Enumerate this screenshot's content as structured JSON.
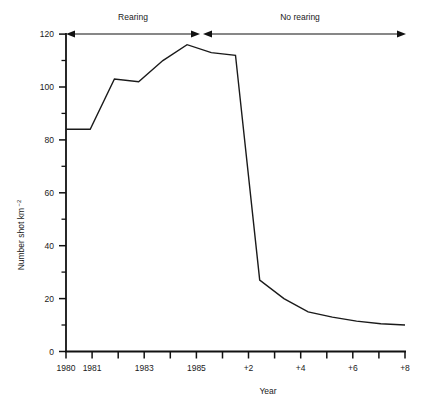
{
  "chart_data": {
    "type": "line",
    "title": "",
    "xlabel": "Year",
    "ylabel": "Number shot km",
    "ylabel_exponent": "−2",
    "ylim": [
      0,
      120
    ],
    "ytick_values": [
      0,
      20,
      40,
      60,
      80,
      100,
      120
    ],
    "ytick_labels": [
      "0",
      "20",
      "40",
      "60",
      "80",
      "100",
      "120"
    ],
    "yminor_values": [
      10,
      30,
      50,
      70,
      90,
      110
    ],
    "grid": false,
    "legend": "none",
    "x": [
      "1980",
      "1981",
      "1982",
      "1983",
      "1984",
      "1985",
      "1986",
      "+1",
      "+2",
      "+3",
      "+4",
      "+5",
      "+6",
      "+7",
      "+8"
    ],
    "xtick_labels": [
      "1980",
      "1981",
      "",
      "1983",
      "",
      "1985",
      "",
      "",
      "+2",
      "",
      "+4",
      "",
      "+6",
      "",
      "+8"
    ],
    "values": [
      84,
      84,
      103,
      102,
      110,
      116,
      113,
      112,
      27,
      20,
      15,
      13,
      11.5,
      10.5,
      10
    ],
    "series": [
      {
        "name": "Number shot per square km",
        "values": [
          84,
          84,
          103,
          102,
          110,
          116,
          113,
          112,
          27,
          20,
          15,
          13,
          11.5,
          10.5,
          10
        ]
      }
    ],
    "annotations": [
      {
        "label": "Rearing",
        "x_start": "1980",
        "x_end": "1986",
        "style": "double-headed-arrow"
      },
      {
        "label": "No rearing",
        "x_start": "1986",
        "x_end": "+8",
        "style": "double-headed-arrow"
      }
    ]
  },
  "axes": {
    "y_title": "Number shot km",
    "y_title_exponent": "−2",
    "x_title": "Year"
  },
  "annotations": {
    "rearing_label": "Rearing",
    "no_rearing_label": "No rearing"
  },
  "colors": {
    "line": "#1a1a1a",
    "axis": "#111111",
    "background": "#ffffff"
  }
}
